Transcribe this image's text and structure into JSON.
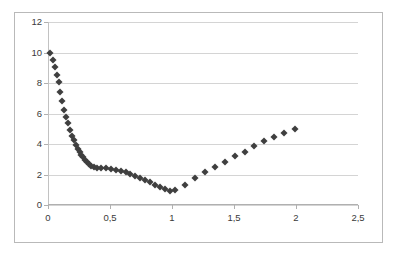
{
  "chart_data": {
    "type": "scatter",
    "title": "",
    "subtitle": "",
    "xlabel": "",
    "ylabel": "",
    "xlim": [
      0,
      2.5
    ],
    "ylim": [
      0,
      12
    ],
    "grid": true,
    "gridlines": "horizontal",
    "legend": "none",
    "marker": "diamond",
    "marker_color": "#3f3f3f",
    "marker_size_px": 5,
    "plot_background": "#ffffff",
    "frame_color": "#b9b9b9",
    "gridline_color": "#d4d4d4",
    "decimal_separator": ",",
    "x_ticks": [
      0,
      0.5,
      1,
      1.5,
      2,
      2.5
    ],
    "x_tick_labels": [
      "0",
      "0,5",
      "1",
      "1,5",
      "2",
      "2,5"
    ],
    "y_ticks": [
      0,
      2,
      4,
      6,
      8,
      10,
      12
    ],
    "y_tick_labels": [
      "0",
      "2",
      "4",
      "6",
      "8",
      "10",
      "12"
    ],
    "series": [
      {
        "name": "series-1",
        "points": [
          [
            0.02,
            10.0
          ],
          [
            0.04,
            9.5
          ],
          [
            0.055,
            9.05
          ],
          [
            0.07,
            8.55
          ],
          [
            0.085,
            8.05
          ],
          [
            0.1,
            7.4
          ],
          [
            0.115,
            6.85
          ],
          [
            0.13,
            6.25
          ],
          [
            0.145,
            5.75
          ],
          [
            0.16,
            5.35
          ],
          [
            0.18,
            4.9
          ],
          [
            0.195,
            4.55
          ],
          [
            0.21,
            4.25
          ],
          [
            0.225,
            3.95
          ],
          [
            0.24,
            3.7
          ],
          [
            0.255,
            3.5
          ],
          [
            0.27,
            3.3
          ],
          [
            0.285,
            3.12
          ],
          [
            0.3,
            2.96
          ],
          [
            0.315,
            2.82
          ],
          [
            0.33,
            2.7
          ],
          [
            0.35,
            2.58
          ],
          [
            0.37,
            2.48
          ],
          [
            0.395,
            2.4
          ],
          [
            0.425,
            2.42
          ],
          [
            0.465,
            2.4
          ],
          [
            0.505,
            2.35
          ],
          [
            0.545,
            2.3
          ],
          [
            0.585,
            2.22
          ],
          [
            0.625,
            2.15
          ],
          [
            0.665,
            2.05
          ],
          [
            0.705,
            1.92
          ],
          [
            0.745,
            1.78
          ],
          [
            0.785,
            1.62
          ],
          [
            0.825,
            1.48
          ],
          [
            0.865,
            1.32
          ],
          [
            0.905,
            1.18
          ],
          [
            0.945,
            1.05
          ],
          [
            0.985,
            0.95
          ],
          [
            1.025,
            0.98
          ],
          [
            1.105,
            1.28
          ],
          [
            1.185,
            1.8
          ],
          [
            1.265,
            2.15
          ],
          [
            1.345,
            2.5
          ],
          [
            1.425,
            2.85
          ],
          [
            1.505,
            3.2
          ],
          [
            1.585,
            3.5
          ],
          [
            1.665,
            3.85
          ],
          [
            1.745,
            4.2
          ],
          [
            1.825,
            4.45
          ],
          [
            1.905,
            4.7
          ],
          [
            1.99,
            5.0
          ]
        ]
      }
    ]
  }
}
